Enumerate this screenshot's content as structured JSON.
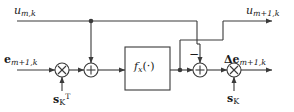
{
  "diagram": {
    "colors": {
      "line": "#3a3a3a",
      "text": "#1a1a1a",
      "background": "#ffffff"
    },
    "labels": {
      "u_input": {
        "base": "u",
        "sub": "m,k"
      },
      "u_output": {
        "base": "u",
        "sub": "m+1,k"
      },
      "e_input": {
        "base": "e",
        "sub": "m+1,k"
      },
      "e_output": {
        "base": "Δe",
        "sub": "m+1,k"
      },
      "s_transpose": {
        "base": "s",
        "sub": "K",
        "sup": "T"
      },
      "s_vector": {
        "base": "s",
        "sub": "K"
      },
      "function_block": "f",
      "function_sub": "x",
      "function_arg": "(·)",
      "minus_sign": "−"
    },
    "nodes": [
      {
        "name": "multiplier-input",
        "type": "multiply",
        "symbol": "×",
        "x": 62,
        "y": 70
      },
      {
        "name": "adder-first",
        "type": "sum",
        "symbol": "+",
        "x": 91,
        "y": 70
      },
      {
        "name": "function-block",
        "type": "block",
        "x": 125,
        "y": 47,
        "width": 45,
        "height": 43
      },
      {
        "name": "adder-second",
        "type": "sum",
        "symbol": "+",
        "x": 200,
        "y": 70
      },
      {
        "name": "multiplier-output",
        "type": "multiply",
        "symbol": "×",
        "x": 234,
        "y": 70
      }
    ],
    "junctions": [
      {
        "name": "junction-top-tap",
        "x": 91,
        "y": 21
      },
      {
        "name": "junction-post-function",
        "x": 180,
        "y": 70
      }
    ]
  }
}
